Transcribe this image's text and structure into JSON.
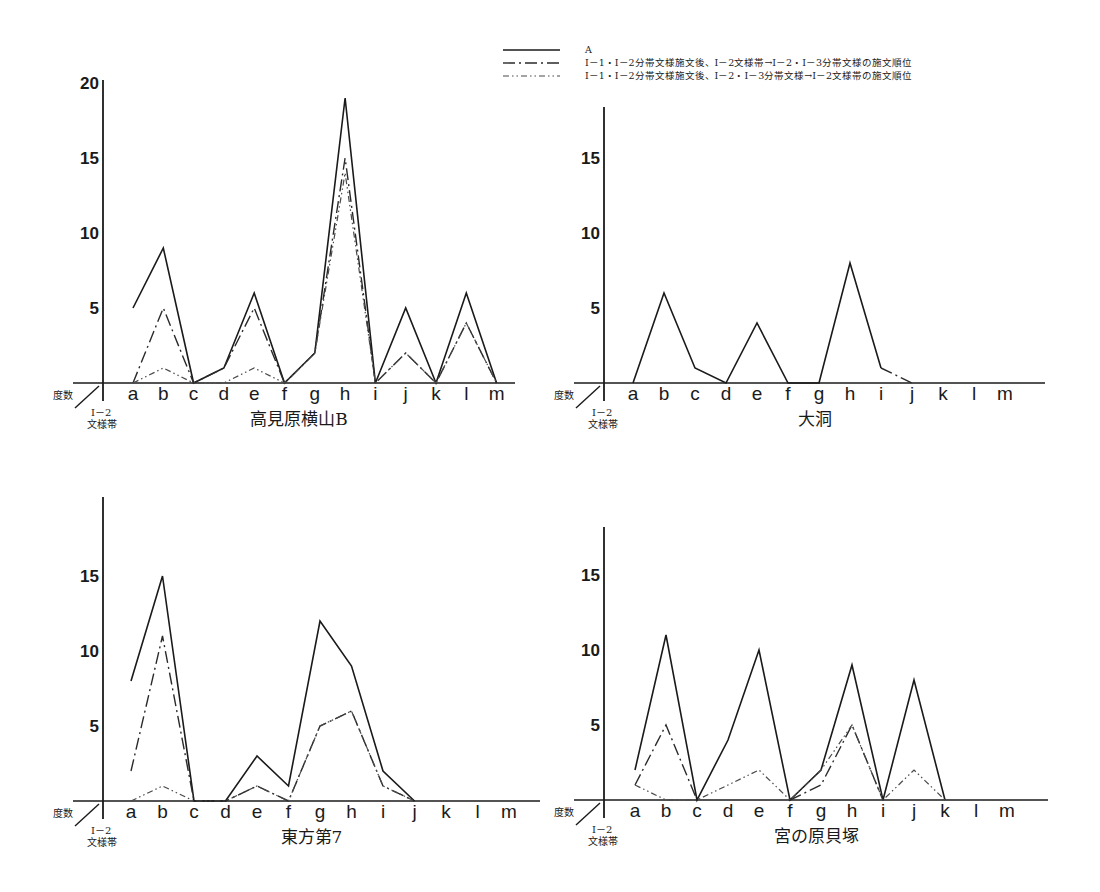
{
  "legend": {
    "items": [
      {
        "style": "solid",
        "label": "A"
      },
      {
        "style": "dash-dot",
        "label": "Ⅰ－1・Ⅰ－2分帯文様施文後、Ⅰ－2文様帯→Ⅰ－2・Ⅰ－3分帯文様の施文順位"
      },
      {
        "style": "dash-dot-dot",
        "label": "Ⅰ－1・Ⅰ－2分帯文様施文後、Ⅰ－2・Ⅰ－3分帯文様→Ⅰ－2文様帯の施文順位"
      }
    ]
  },
  "axis_labels": {
    "y_corner": "度数",
    "x_corner_line1": "Ⅰ－2",
    "x_corner_line2": "文様帯"
  },
  "chart_data": [
    {
      "type": "line",
      "title": "高見原横山B",
      "xlabel": "Ⅰ－2文様帯",
      "ylabel": "度数",
      "categories": [
        "a",
        "b",
        "c",
        "d",
        "e",
        "f",
        "g",
        "h",
        "i",
        "j",
        "k",
        "l",
        "m"
      ],
      "yticks": [
        5,
        10,
        15,
        20
      ],
      "ylim": [
        0,
        20
      ],
      "grid": false,
      "legend_position": "top-right",
      "series": [
        {
          "name": "A",
          "style": "solid",
          "values": [
            5,
            9,
            0,
            1,
            6,
            0,
            2,
            19,
            0,
            5,
            0,
            6,
            0
          ]
        },
        {
          "name": "Ⅰ－2文様帯→Ⅰ－2・Ⅰ－3分帯文様",
          "style": "dash-dot",
          "values": [
            0,
            5,
            0,
            1,
            5,
            0,
            2,
            15,
            0,
            2,
            0,
            4,
            0
          ]
        },
        {
          "name": "Ⅰ－2・Ⅰ－3分帯文様→Ⅰ－2文様帯",
          "style": "dash-dot-dot",
          "values": [
            0,
            1,
            0,
            0,
            1,
            0,
            2,
            14,
            0,
            2,
            0,
            4,
            0
          ]
        }
      ]
    },
    {
      "type": "line",
      "title": "大洞",
      "xlabel": "Ⅰ－2文様帯",
      "ylabel": "度数",
      "categories": [
        "a",
        "b",
        "c",
        "d",
        "e",
        "f",
        "g",
        "h",
        "i",
        "j",
        "k",
        "l",
        "m"
      ],
      "yticks": [
        5,
        10,
        15
      ],
      "ylim": [
        0,
        18
      ],
      "grid": false,
      "series": [
        {
          "name": "A",
          "style": "solid",
          "values": [
            0,
            6,
            1,
            0,
            4,
            0,
            0,
            8,
            1,
            null,
            null,
            null,
            null
          ]
        },
        {
          "name": "Ⅰ－2文様帯→Ⅰ－2・Ⅰ－3分帯文様",
          "style": "dash-dot",
          "values": [
            null,
            null,
            null,
            null,
            null,
            null,
            null,
            null,
            1,
            0,
            null,
            null,
            null
          ]
        }
      ]
    },
    {
      "type": "line",
      "title": "東方第7",
      "xlabel": "Ⅰ－2文様帯",
      "ylabel": "度数",
      "categories": [
        "a",
        "b",
        "c",
        "d",
        "e",
        "f",
        "g",
        "h",
        "i",
        "j",
        "k",
        "l",
        "m"
      ],
      "yticks": [
        5,
        10,
        15
      ],
      "ylim": [
        0,
        18
      ],
      "grid": false,
      "series": [
        {
          "name": "A",
          "style": "solid",
          "values": [
            8,
            15,
            0,
            0,
            3,
            1,
            12,
            9,
            2,
            0,
            null,
            null,
            null
          ]
        },
        {
          "name": "Ⅰ－2文様帯→Ⅰ－2・Ⅰ－3分帯文様",
          "style": "dash-dot",
          "values": [
            2,
            11,
            0,
            0,
            1,
            0,
            5,
            6,
            1,
            0,
            null,
            null,
            null
          ]
        },
        {
          "name": "Ⅰ－2・Ⅰ－3分帯文様→Ⅰ－2文様帯",
          "style": "dash-dot-dot",
          "values": [
            0,
            1,
            0,
            0,
            1,
            0,
            5,
            6,
            1,
            0,
            null,
            null,
            null
          ]
        }
      ]
    },
    {
      "type": "line",
      "title": "宮の原貝塚",
      "xlabel": "Ⅰ－2文様帯",
      "ylabel": "度数",
      "categories": [
        "a",
        "b",
        "c",
        "d",
        "e",
        "f",
        "g",
        "h",
        "i",
        "j",
        "k",
        "l",
        "m"
      ],
      "yticks": [
        5,
        10,
        15
      ],
      "ylim": [
        0,
        18
      ],
      "grid": false,
      "series": [
        {
          "name": "A",
          "style": "solid",
          "values": [
            2,
            11,
            0,
            4,
            10,
            0,
            2,
            9,
            0,
            8,
            0,
            null,
            null
          ]
        },
        {
          "name": "Ⅰ－2文様帯→Ⅰ－2・Ⅰ－3分帯文様",
          "style": "dash-dot",
          "values": [
            1,
            5,
            0,
            null,
            null,
            0,
            1,
            5,
            0,
            null,
            null,
            null,
            null
          ]
        },
        {
          "name": "Ⅰ－2・Ⅰ－3分帯文様→Ⅰ－2文様帯",
          "style": "dash-dot-dot",
          "values": [
            1,
            0,
            0,
            1,
            2,
            0,
            2,
            5,
            0,
            2,
            0,
            null,
            null
          ]
        }
      ]
    }
  ],
  "panels": [
    {
      "ox": 103,
      "oy": 383,
      "top": 80,
      "unit": 15.0,
      "xstart": 133,
      "xstep": 30.3,
      "xend": 515
    },
    {
      "ox": 604,
      "oy": 383,
      "top": 107,
      "unit": 15.0,
      "xstart": 633,
      "xstep": 31.0,
      "xend": 1045
    },
    {
      "ox": 103,
      "oy": 801,
      "top": 497,
      "unit": 15.0,
      "xstart": 131,
      "xstep": 31.5,
      "xend": 540
    },
    {
      "ox": 604,
      "oy": 800,
      "top": 527,
      "unit": 15.0,
      "xstart": 635,
      "xstep": 31.0,
      "xend": 1048
    }
  ]
}
